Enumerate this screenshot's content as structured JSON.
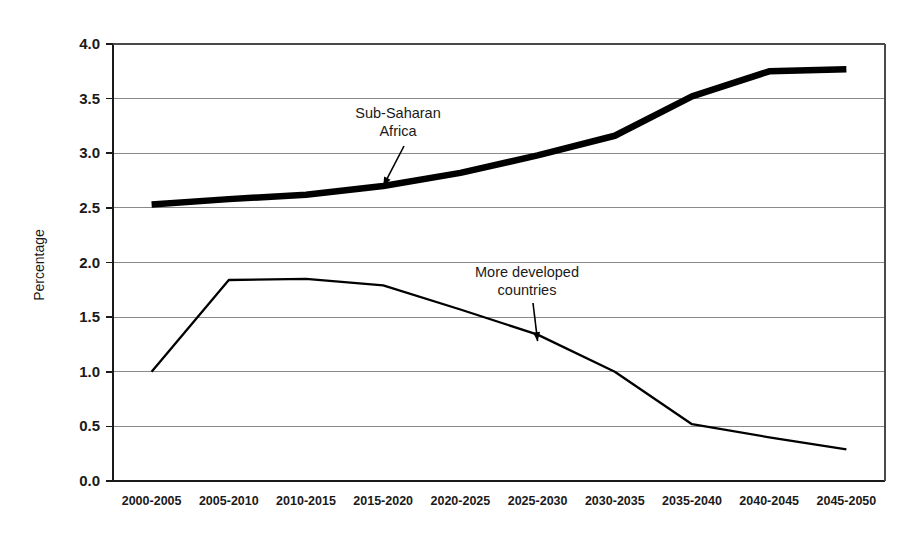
{
  "chart_data": {
    "type": "line",
    "title": "",
    "subtitle": "",
    "xlabel": "",
    "ylabel": "Percentage",
    "ylim": [
      0.0,
      4.0
    ],
    "ytick_labels": [
      "4.0",
      "3.5",
      "3.0",
      "2.5",
      "2.0",
      "1.5",
      "1.0",
      "0.5",
      "0.0"
    ],
    "ytick_values": [
      4.0,
      3.5,
      3.0,
      2.5,
      2.0,
      1.5,
      1.0,
      0.5,
      0.0
    ],
    "grid": "horizontal",
    "legend": "none",
    "categories": [
      "2000-2005",
      "2005-2010",
      "2010-2015",
      "2015-2020",
      "2020-2025",
      "2025-2030",
      "2030-2035",
      "2035-2040",
      "2040-2045",
      "2045-2050"
    ],
    "series": [
      {
        "name": "Sub-Saharan Africa",
        "style": "thick",
        "values": [
          2.53,
          2.58,
          2.62,
          2.7,
          2.82,
          2.98,
          3.16,
          3.52,
          3.75,
          3.77
        ]
      },
      {
        "name": "More developed countries",
        "style": "thin",
        "values": [
          1.0,
          1.84,
          1.85,
          1.79,
          1.57,
          1.34,
          1.0,
          0.52,
          0.4,
          0.29
        ]
      }
    ],
    "annotations": [
      {
        "id": "sub-saharan-africa",
        "lines": [
          "Sub-Saharan",
          "Africa"
        ],
        "target_category": "2015-2020",
        "target_value": 2.7
      },
      {
        "id": "more-developed-countries",
        "lines": [
          "More developed",
          "countries"
        ],
        "target_category": "2025-2030",
        "target_value": 1.28
      }
    ],
    "colors": {
      "series_line": "#000000",
      "gridline": "#8a8a8a",
      "axis": "#1a1a1a",
      "background": "#ffffff"
    }
  }
}
